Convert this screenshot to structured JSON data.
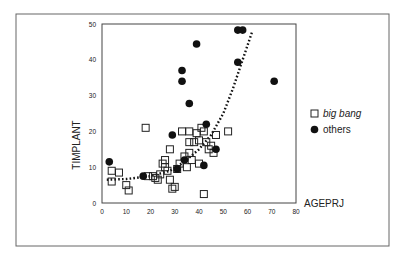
{
  "chart_data": {
    "type": "scatter",
    "title": "",
    "xlabel": "AGEPRJ",
    "ylabel": "TIMPLANT",
    "xlim": [
      0,
      80
    ],
    "ylim": [
      0,
      50
    ],
    "xticks": [
      0,
      10,
      20,
      30,
      40,
      50,
      60,
      70,
      80
    ],
    "yticks": [
      0,
      10,
      20,
      30,
      40,
      50
    ],
    "grid": false,
    "legend_position": "right",
    "series": [
      {
        "name": "big bang",
        "marker": "open-square",
        "label_style": "italic",
        "points": [
          [
            4,
            9
          ],
          [
            7,
            8.5
          ],
          [
            4,
            6
          ],
          [
            10,
            5
          ],
          [
            11,
            3.5
          ],
          [
            18,
            21
          ],
          [
            19,
            7.5
          ],
          [
            21,
            7.5
          ],
          [
            22,
            7
          ],
          [
            23,
            6.5
          ],
          [
            24,
            8
          ],
          [
            25,
            11
          ],
          [
            26,
            12
          ],
          [
            26,
            10
          ],
          [
            27,
            9
          ],
          [
            28,
            15
          ],
          [
            29,
            4
          ],
          [
            30,
            4.5
          ],
          [
            28,
            6.5
          ],
          [
            31,
            9.5
          ],
          [
            32,
            11
          ],
          [
            33,
            20
          ],
          [
            34,
            13
          ],
          [
            35,
            10
          ],
          [
            36,
            20
          ],
          [
            36,
            17
          ],
          [
            36,
            14
          ],
          [
            37,
            12
          ],
          [
            38,
            17
          ],
          [
            39,
            19.5
          ],
          [
            40,
            17.5
          ],
          [
            40,
            11
          ],
          [
            41,
            21
          ],
          [
            42,
            20
          ],
          [
            43,
            17
          ],
          [
            42,
            2.5
          ],
          [
            44,
            15
          ],
          [
            45,
            16
          ],
          [
            46,
            14
          ],
          [
            47,
            19
          ],
          [
            52,
            20
          ]
        ]
      },
      {
        "name": "others",
        "marker": "filled-circle",
        "label_style": "normal",
        "points": [
          [
            3,
            11.5
          ],
          [
            17,
            7.5
          ],
          [
            29,
            19
          ],
          [
            31,
            9.5
          ],
          [
            34,
            12
          ],
          [
            36,
            27.8
          ],
          [
            33,
            37
          ],
          [
            33,
            34
          ],
          [
            39,
            44.4
          ],
          [
            42,
            10.5
          ],
          [
            43,
            22
          ],
          [
            47,
            15
          ],
          [
            56,
            48.3
          ],
          [
            58,
            48.3
          ],
          [
            56,
            39.3
          ],
          [
            71,
            34
          ]
        ]
      }
    ],
    "trendline": {
      "style": "dotted",
      "kind": "exponential",
      "points": [
        [
          2,
          6.5
        ],
        [
          10,
          6.7
        ],
        [
          20,
          7.5
        ],
        [
          28,
          9
        ],
        [
          34,
          11.5
        ],
        [
          40,
          15
        ],
        [
          45,
          19
        ],
        [
          50,
          25
        ],
        [
          54,
          32
        ],
        [
          57,
          38
        ],
        [
          60,
          44
        ],
        [
          62,
          48
        ]
      ]
    },
    "legend": [
      {
        "label": "big bang",
        "marker": "open-square"
      },
      {
        "label": "others",
        "marker": "filled-circle"
      }
    ]
  },
  "colors": {
    "frame": "#555555",
    "axis": "#333333",
    "marker": "#111111",
    "background": "#ffffff"
  }
}
